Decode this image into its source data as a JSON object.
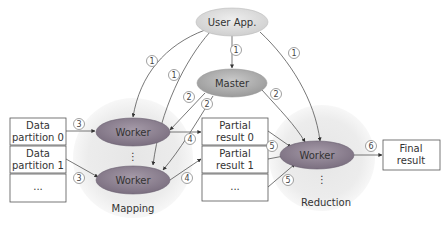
{
  "diagram": {
    "type": "flowchart",
    "nodes": {
      "user_app": {
        "label": "User App."
      },
      "master": {
        "label": "Master"
      },
      "map_worker_0": {
        "label": "Worker"
      },
      "map_worker_1": {
        "label": "Worker"
      },
      "reduce_worker": {
        "label": "Worker"
      },
      "map_ellipsis": {
        "label": "⋮"
      },
      "reduce_ellipsis": {
        "label": "⋮"
      }
    },
    "inputs": [
      {
        "line1": "Data",
        "line2": "partition 0"
      },
      {
        "line1": "Data",
        "line2": "partition 1"
      },
      {
        "line1": "...",
        "line2": ""
      }
    ],
    "partials": [
      {
        "line1": "Partial",
        "line2": "result 0"
      },
      {
        "line1": "Partial",
        "line2": "result 1"
      },
      {
        "line1": "...",
        "line2": ""
      }
    ],
    "final": {
      "line1": "Final",
      "line2": "result"
    },
    "phases": {
      "mapping": "Mapping",
      "reduction": "Reduction"
    },
    "steps": {
      "s1": "1",
      "s2": "2",
      "s3": "3",
      "s4": "4",
      "s5": "5",
      "s6": "6"
    },
    "edges": [
      {
        "from": "user_app",
        "to": "map_worker_0",
        "step": "1"
      },
      {
        "from": "user_app",
        "to": "map_worker_1",
        "step": "1"
      },
      {
        "from": "user_app",
        "to": "master",
        "step": "1"
      },
      {
        "from": "user_app",
        "to": "reduce_worker",
        "step": "1"
      },
      {
        "from": "master",
        "to": "map_worker_0",
        "step": "2"
      },
      {
        "from": "master",
        "to": "map_worker_1",
        "step": "2"
      },
      {
        "from": "master",
        "to": "reduce_worker",
        "step": "2"
      },
      {
        "from": "data_partition_0",
        "to": "map_worker_0",
        "step": "3"
      },
      {
        "from": "data_partition_1",
        "to": "map_worker_1",
        "step": "3"
      },
      {
        "from": "map_worker_0",
        "to": "partial_result_0",
        "step": "4"
      },
      {
        "from": "map_worker_1",
        "to": "partial_result_1",
        "step": "4"
      },
      {
        "from": "partial_result_0",
        "to": "reduce_worker",
        "step": "5"
      },
      {
        "from": "partial_result_1",
        "to": "reduce_worker",
        "step": ""
      },
      {
        "from": "partial_result_more",
        "to": "reduce_worker",
        "step": "5"
      },
      {
        "from": "reduce_worker",
        "to": "final_result",
        "step": "6"
      }
    ]
  }
}
